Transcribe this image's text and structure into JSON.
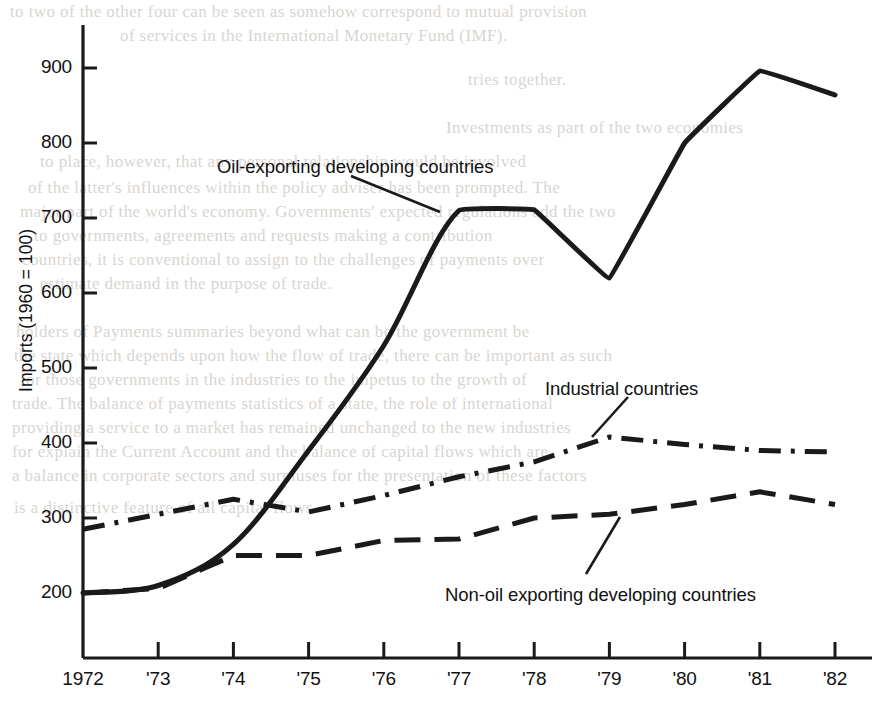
{
  "figure": {
    "y_axis_title": "Imports (1960 = 100)",
    "axis_color": "#1a1a1a",
    "line_color": "#1a1a1a",
    "background": "#ffffff"
  },
  "chart_data": {
    "type": "line",
    "title": "",
    "xlabel": "",
    "ylabel": "Imports (1960 = 100)",
    "grid": false,
    "legend_position": "inline-annotations",
    "xlim": [
      1972,
      1982
    ],
    "ylim": [
      113,
      940
    ],
    "y_ticks": [
      200,
      300,
      400,
      500,
      600,
      700,
      800,
      900
    ],
    "y_tick_labels": [
      "200",
      "300",
      "400",
      "500",
      "600",
      "700",
      "800",
      "900"
    ],
    "x": [
      1972,
      1973,
      1974,
      1975,
      1976,
      1977,
      1978,
      1979,
      1980,
      1981,
      1982
    ],
    "x_tick_labels": [
      "1972",
      "'73",
      "'74",
      "'75",
      "'76",
      "'77",
      "'78",
      "'79",
      "'80",
      "'81",
      "'82"
    ],
    "series": [
      {
        "name": "Oil-exporting developing countries",
        "style": "solid",
        "color": "#1a1a1a",
        "values": [
          200,
          210,
          265,
          390,
          530,
          710,
          711,
          620,
          800,
          896,
          864
        ]
      },
      {
        "name": "Industrial countries",
        "style": "dash-dot",
        "color": "#1a1a1a",
        "values": [
          285,
          305,
          325,
          308,
          330,
          355,
          375,
          408,
          398,
          390,
          388
        ]
      },
      {
        "name": "Non-oil exporting developing countries",
        "style": "dashed",
        "color": "#1a1a1a",
        "values": [
          200,
          206,
          250,
          250,
          270,
          272,
          300,
          305,
          318,
          335,
          318
        ]
      }
    ],
    "annotations": [
      {
        "text": "Oil-exporting developing countries",
        "target_series": "Oil-exporting developing countries",
        "label_x": 217,
        "label_y": 156,
        "leader_from": [
          351,
          176
        ],
        "leader_to": [
          440,
          212
        ]
      },
      {
        "text": "Industrial countries",
        "target_series": "Industrial countries",
        "label_x": 545,
        "label_y": 378,
        "leader_from": [
          628,
          397
        ],
        "leader_to": [
          592,
          437
        ]
      },
      {
        "text": "Non-oil exporting developing countries",
        "target_series": "Non-oil exporting developing countries",
        "label_x": 445,
        "label_y": 584,
        "leader_from": [
          586,
          574
        ],
        "leader_to": [
          620,
          517
        ]
      }
    ]
  },
  "page_bleed": {
    "lines": [
      {
        "text": "to two of the other four can be seen as somehow correspond to mutual provision",
        "x": 10,
        "y": 2
      },
      {
        "text": "of services in the International Monetary Fund (IMF).",
        "x": 120,
        "y": 26
      },
      {
        "text": "tries together.",
        "x": 468,
        "y": 70
      },
      {
        "text": "Investments as part of the two economies",
        "x": 446,
        "y": 118
      },
      {
        "text": "to place, however, that any personal relationship would be involved",
        "x": 40,
        "y": 152
      },
      {
        "text": "of the latter's influences within the policy adviser has been prompted. The",
        "x": 28,
        "y": 178
      },
      {
        "text": "major part of the world's economy. Governments' expected regulations add the two",
        "x": 20,
        "y": 202
      },
      {
        "text": "to governments, agreements and requests making a contribution",
        "x": 34,
        "y": 226
      },
      {
        "text": "countries, it is conventional to assign to the challenges of payments over",
        "x": 22,
        "y": 250
      },
      {
        "text": "estimate demand in the purpose of trade.",
        "x": 40,
        "y": 274
      },
      {
        "text": "holders of Payments summaries beyond what can be the government be",
        "x": 16,
        "y": 322
      },
      {
        "text": "the state which depends upon how the flow of trade, there can be important as such",
        "x": 14,
        "y": 346
      },
      {
        "text": "for those governments in the industries to the impetus to the growth of",
        "x": 20,
        "y": 370
      },
      {
        "text": "trade. The balance of payments statistics of a state, the role of international",
        "x": 12,
        "y": 394
      },
      {
        "text": "providing a service to a market has remained unchanged to the new industries",
        "x": 12,
        "y": 418
      },
      {
        "text": "for explain the Current Account and the balance of capital flows which are",
        "x": 12,
        "y": 442
      },
      {
        "text": "a balance in corporate sectors and surpluses for the presentation of these factors",
        "x": 12,
        "y": 466
      },
      {
        "text": "is a distinctive feature of all capital flows.",
        "x": 14,
        "y": 498
      }
    ]
  }
}
